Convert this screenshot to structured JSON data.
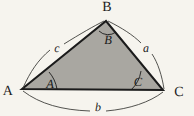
{
  "figure": {
    "name": "triangle-with-angles-and-sides",
    "background_color": "#f6f4ee",
    "fill_color": "#a9a7a1",
    "stroke_color": "#1b1b1b",
    "arc_color": "#3a3a38",
    "vertices": {
      "A": {
        "x": 22,
        "y": 89,
        "label": "A",
        "label_x": 8,
        "label_y": 92
      },
      "B": {
        "x": 106,
        "y": 21,
        "label": "B",
        "label_x": 107,
        "label_y": 8
      },
      "C": {
        "x": 163,
        "y": 90,
        "label": "C",
        "label_x": 179,
        "label_y": 93
      }
    },
    "angles": [
      {
        "name": "angle-a",
        "label": "A",
        "label_x": 50,
        "label_y": 84
      },
      {
        "name": "angle-b",
        "label": "B",
        "label_x": 108,
        "label_y": 40
      },
      {
        "name": "angle-c",
        "label": "C",
        "label_x": 138,
        "label_y": 82
      }
    ],
    "sides": [
      {
        "name": "side-a",
        "label": "a",
        "label_x": 146,
        "label_y": 48,
        "between": "B-C"
      },
      {
        "name": "side-b",
        "label": "b",
        "label_x": 98,
        "label_y": 107,
        "between": "A-C"
      },
      {
        "name": "side-c",
        "label": "c",
        "label_x": 57,
        "label_y": 48,
        "between": "A-B"
      }
    ]
  }
}
